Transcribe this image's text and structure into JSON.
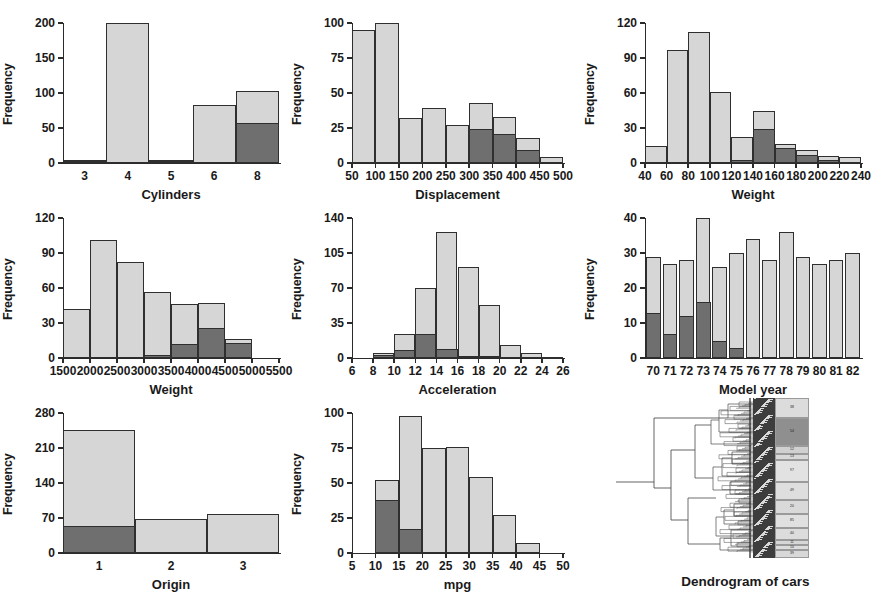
{
  "figure": {
    "title": "",
    "panel_count": 9,
    "colors": {
      "bar_light": "#d6d6d6",
      "bar_dark": "#6f6f6f",
      "outline": "#2f2f2f",
      "text": "#1a1a1a"
    }
  },
  "chart_data": [
    {
      "type": "bar",
      "title": "",
      "xlabel": "Cylinders",
      "ylabel": "Frequency",
      "categories": [
        "3",
        "4",
        "5",
        "6",
        "8"
      ],
      "xticklabels": [
        "3",
        "4",
        "5",
        "6",
        "8"
      ],
      "yticklabels": [
        "0",
        "50",
        "100",
        "150",
        "200"
      ],
      "yticks": [
        0,
        50,
        100,
        150,
        200
      ],
      "ylim": [
        0,
        200
      ],
      "grid": false,
      "legend": "none",
      "series": [
        {
          "name": "total",
          "values": [
            4,
            200,
            4,
            83,
            103
          ]
        },
        {
          "name": "highlighted",
          "values": [
            1,
            0,
            1,
            0,
            57
          ]
        }
      ]
    },
    {
      "type": "bar",
      "title": "",
      "xlabel": "Displacement",
      "ylabel": "Frequency",
      "categories": [
        "50-100",
        "100-150",
        "150-200",
        "200-250",
        "250-300",
        "300-350",
        "350-400",
        "400-450",
        "450-500"
      ],
      "xticklabels": [
        "50",
        "100",
        "150",
        "200",
        "250",
        "300",
        "350",
        "400",
        "450",
        "500"
      ],
      "yticklabels": [
        "0",
        "25",
        "50",
        "75",
        "100"
      ],
      "yticks": [
        0,
        25,
        50,
        75,
        100
      ],
      "ylim": [
        0,
        100
      ],
      "grid": false,
      "legend": "none",
      "series": [
        {
          "name": "total",
          "values": [
            95,
            100,
            32,
            39,
            27,
            43,
            33,
            18,
            4
          ]
        },
        {
          "name": "highlighted",
          "values": [
            0,
            0,
            0,
            0,
            0,
            24,
            21,
            9,
            0
          ]
        }
      ]
    },
    {
      "type": "bar",
      "title": "",
      "xlabel": "Weight",
      "ylabel": "Frequency",
      "categories": [
        "40-60",
        "60-80",
        "80-100",
        "100-120",
        "120-140",
        "140-160",
        "160-180",
        "180-200",
        "200-220",
        "220-240"
      ],
      "xticklabels": [
        "40",
        "60",
        "80",
        "100",
        "120",
        "140",
        "160",
        "180",
        "200",
        "220",
        "240"
      ],
      "yticklabels": [
        "0",
        "30",
        "60",
        "90",
        "120"
      ],
      "yticks": [
        0,
        30,
        60,
        90,
        120
      ],
      "ylim": [
        0,
        120
      ],
      "grid": false,
      "legend": "none",
      "series": [
        {
          "name": "total",
          "values": [
            15,
            97,
            112,
            61,
            22,
            45,
            16,
            11,
            6,
            5
          ]
        },
        {
          "name": "highlighted",
          "values": [
            0,
            0,
            0,
            0,
            3,
            29,
            13,
            7,
            3,
            0
          ]
        }
      ]
    },
    {
      "type": "bar",
      "title": "",
      "xlabel": "Weight",
      "ylabel": "Frequency",
      "categories": [
        "1500-2000",
        "2000-2500",
        "2500-3000",
        "3000-3500",
        "3500-4000",
        "4000-4500",
        "4500-5000"
      ],
      "xticklabels": [
        "1500",
        "2000",
        "2500",
        "3000",
        "3500",
        "4000",
        "4500",
        "5000",
        "5500"
      ],
      "yticklabels": [
        "0",
        "30",
        "60",
        "90",
        "120"
      ],
      "yticks": [
        0,
        30,
        60,
        90,
        120
      ],
      "ylim": [
        0,
        120
      ],
      "grid": false,
      "legend": "none",
      "series": [
        {
          "name": "total",
          "values": [
            42,
            101,
            82,
            57,
            46,
            47,
            16
          ]
        },
        {
          "name": "highlighted",
          "values": [
            0,
            0,
            0,
            3,
            12,
            26,
            13
          ]
        }
      ]
    },
    {
      "type": "bar",
      "title": "",
      "xlabel": "Acceleration",
      "ylabel": "Frequency",
      "categories": [
        "8-10",
        "10-12",
        "12-14",
        "14-16",
        "16-18",
        "18-20",
        "20-22",
        "22-24",
        "24-26"
      ],
      "xticklabels": [
        "6",
        "8",
        "10",
        "12",
        "14",
        "16",
        "18",
        "20",
        "22",
        "24",
        "26"
      ],
      "yticklabels": [
        "0",
        "35",
        "70",
        "105",
        "140"
      ],
      "yticks": [
        0,
        35,
        70,
        105,
        140
      ],
      "ylim": [
        0,
        140
      ],
      "grid": false,
      "legend": "none",
      "series": [
        {
          "name": "total",
          "values": [
            5,
            24,
            70,
            126,
            91,
            53,
            13,
            5,
            1
          ]
        },
        {
          "name": "highlighted",
          "values": [
            3,
            8,
            24,
            9,
            2,
            2,
            0,
            0,
            0
          ]
        }
      ]
    },
    {
      "type": "bar",
      "title": "",
      "xlabel": "Model year",
      "ylabel": "Frequency",
      "categories": [
        "70",
        "71",
        "72",
        "73",
        "74",
        "75",
        "76",
        "77",
        "78",
        "79",
        "80",
        "81",
        "82"
      ],
      "xticklabels": [
        "70",
        "71",
        "72",
        "73",
        "74",
        "75",
        "76",
        "77",
        "78",
        "79",
        "80",
        "81",
        "82"
      ],
      "yticklabels": [
        "0",
        "10",
        "20",
        "30",
        "40"
      ],
      "yticks": [
        0,
        10,
        20,
        30,
        40
      ],
      "ylim": [
        0,
        40
      ],
      "grid": false,
      "legend": "none",
      "series": [
        {
          "name": "total",
          "values": [
            29,
            27,
            28,
            40,
            26,
            30,
            34,
            28,
            36,
            29,
            27,
            28,
            30
          ]
        },
        {
          "name": "highlighted",
          "values": [
            13,
            7,
            12,
            16,
            5,
            3,
            0,
            0,
            0,
            0,
            0,
            0,
            0
          ]
        }
      ]
    },
    {
      "type": "bar",
      "title": "",
      "xlabel": "Origin",
      "ylabel": "Frequency",
      "categories": [
        "1",
        "2",
        "3"
      ],
      "xticklabels": [
        "1",
        "2",
        "3"
      ],
      "yticklabels": [
        "0",
        "70",
        "140",
        "210",
        "280"
      ],
      "yticks": [
        0,
        70,
        140,
        210,
        280
      ],
      "ylim": [
        0,
        280
      ],
      "grid": false,
      "legend": "none",
      "series": [
        {
          "name": "total",
          "values": [
            247,
            68,
            79
          ]
        },
        {
          "name": "highlighted",
          "values": [
            55,
            0,
            0
          ]
        }
      ]
    },
    {
      "type": "bar",
      "title": "",
      "xlabel": "mpg",
      "ylabel": "Frequency",
      "categories": [
        "10-15",
        "15-20",
        "20-25",
        "25-30",
        "30-35",
        "35-40",
        "40-45"
      ],
      "xticklabels": [
        "5",
        "10",
        "15",
        "20",
        "25",
        "30",
        "35",
        "40",
        "45",
        "50"
      ],
      "yticklabels": [
        "0",
        "25",
        "50",
        "75",
        "100"
      ],
      "yticks": [
        0,
        25,
        50,
        75,
        100
      ],
      "ylim": [
        0,
        100
      ],
      "grid": false,
      "legend": "none",
      "series": [
        {
          "name": "total",
          "values": [
            52,
            98,
            75,
            76,
            54,
            27,
            7
          ]
        },
        {
          "name": "highlighted",
          "values": [
            38,
            17,
            0,
            0,
            0,
            0,
            0
          ]
        }
      ]
    },
    {
      "type": "dendrogram",
      "title": "Dendrogram of cars",
      "xlabel": "Dendrogram of cars",
      "ylabel": "",
      "orientation": "horizontal",
      "cluster_block_labels": [
        "38",
        "54",
        "12",
        "13",
        "97",
        "49",
        "20",
        "85",
        "40",
        "11",
        "10",
        "39"
      ],
      "notes": "hierarchical clustering tree with heatmap strip and cluster size labels"
    }
  ],
  "panels": [
    {
      "id": "cylinders",
      "xlabel": "Cylinders",
      "ylabel": "Frequency"
    },
    {
      "id": "displacement",
      "xlabel": "Displacement",
      "ylabel": "Frequency"
    },
    {
      "id": "horsepower",
      "xlabel": "Weight",
      "ylabel": "Frequency"
    },
    {
      "id": "weight",
      "xlabel": "Weight",
      "ylabel": "Frequency"
    },
    {
      "id": "acceleration",
      "xlabel": "Acceleration",
      "ylabel": "Frequency"
    },
    {
      "id": "model-year",
      "xlabel": "Model year",
      "ylabel": "Frequency"
    },
    {
      "id": "origin",
      "xlabel": "Origin",
      "ylabel": "Frequency"
    },
    {
      "id": "mpg",
      "xlabel": "mpg",
      "ylabel": "Frequency"
    },
    {
      "id": "dendrogram",
      "xlabel": "Dendrogram of cars",
      "ylabel": ""
    }
  ]
}
